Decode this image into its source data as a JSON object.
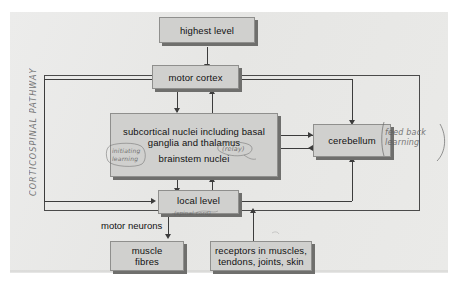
{
  "figure": {
    "boxes": {
      "highest_level": "highest level",
      "motor_cortex": "motor cortex",
      "subcortical_line1": "subcortical nuclei including basal",
      "subcortical_line2": "ganglia and thalamus",
      "subcortical_line3": "brainstem nuclei",
      "cerebellum": "cerebellum",
      "local_level": "local level",
      "muscle_line1": "muscle",
      "muscle_line2": "fibres",
      "receptors_line1": "receptors in muscles,",
      "receptors_line2": "tendons, joints, skin"
    },
    "printed_labels": {
      "motor_neurons": "motor neurons"
    },
    "handwritten_annotations": {
      "pathway": "CORTICOSPINAL PATHWAY",
      "initiating": "initiating\nlearning",
      "relay": "(relay)",
      "feedback": "feed back\nlearning",
      "spinal_cord": "(spinal cord)"
    },
    "colors": {
      "paper": "#e9e9e7",
      "box_fill": "#d0d0ce",
      "box_border": "#8f8f8d",
      "box_shadow": "#6f6f6d",
      "connector": "#3c3c3c",
      "pencil": "#5d5d5d"
    }
  }
}
